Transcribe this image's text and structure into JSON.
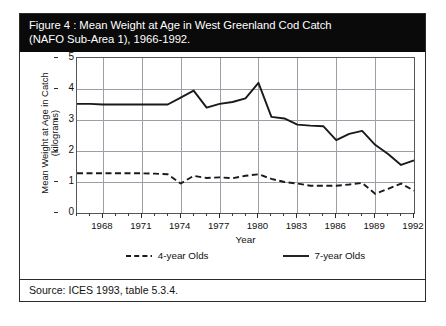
{
  "figure": {
    "title_line1": "Figure 4 : Mean Weight at Age in West Greenland Cod Catch",
    "title_line2": "(NAFO Sub-Area 1), 1966-1992.",
    "source": "Source: ICES 1993, table 5.3.4."
  },
  "colors": {
    "title_bar_background": "#0a0a0a",
    "title_bar_text": "#ffffff",
    "frame_border": "#2b2b2b",
    "gridline": "#9aa0a6",
    "series_line": "#1a1a1a",
    "page_background": "#ffffff"
  },
  "chart_data": {
    "type": "line",
    "title": "Figure 4 : Mean Weight at Age in West Greenland Cod Catch (NAFO Sub-Area 1), 1966-1992.",
    "xlabel": "Year",
    "ylabel": "Mean Weight at Age in Catch (kilograms)",
    "ylabel_line1": "Mean Weight at Age in Catch",
    "ylabel_line2": "(kilograms)",
    "grid": true,
    "legend_position": "bottom",
    "xlim": [
      1966,
      1992
    ],
    "ylim": [
      0,
      5
    ],
    "ytick_values": [
      0,
      1,
      2,
      3,
      4,
      5
    ],
    "ytick_labels": [
      "0",
      "1",
      "2",
      "3",
      "4",
      "5"
    ],
    "xtick_values": [
      1968,
      1971,
      1974,
      1977,
      1980,
      1983,
      1986,
      1989,
      1992
    ],
    "xtick_labels": [
      "1968",
      "1971",
      "1974",
      "1977",
      "1980",
      "1983",
      "1986",
      "1989",
      "1992"
    ],
    "x_minor_step": 1,
    "x": [
      1966,
      1967,
      1968,
      1969,
      1970,
      1971,
      1972,
      1973,
      1974,
      1975,
      1976,
      1977,
      1978,
      1979,
      1980,
      1981,
      1982,
      1983,
      1984,
      1985,
      1986,
      1987,
      1988,
      1989,
      1990,
      1991,
      1992
    ],
    "series": [
      {
        "name": "4-year Olds",
        "style": "dashed",
        "values": [
          1.28,
          1.28,
          1.28,
          1.28,
          1.28,
          1.28,
          1.27,
          1.25,
          0.95,
          1.2,
          1.13,
          1.15,
          1.12,
          1.2,
          1.25,
          1.1,
          1.0,
          0.95,
          0.88,
          0.88,
          0.88,
          0.92,
          0.97,
          0.62,
          0.78,
          0.95,
          0.72
        ]
      },
      {
        "name": "7-year Olds",
        "style": "solid",
        "values": [
          3.52,
          3.52,
          3.5,
          3.5,
          3.5,
          3.5,
          3.5,
          3.5,
          3.72,
          3.95,
          3.4,
          3.52,
          3.58,
          3.7,
          4.2,
          3.1,
          3.05,
          2.85,
          2.82,
          2.8,
          2.35,
          2.55,
          2.65,
          2.2,
          1.9,
          1.55,
          1.7
        ]
      }
    ]
  }
}
